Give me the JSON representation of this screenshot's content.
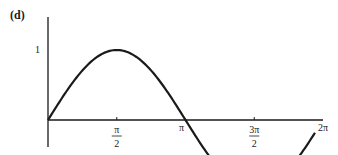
{
  "panel_label": "(d)",
  "chart_data": {
    "type": "line",
    "title": "",
    "panel": "(d)",
    "function": "sin(x)",
    "xlabel": "",
    "ylabel": "",
    "x_ticks": [
      {
        "value": 1.5708,
        "label": "π/2",
        "num": "π",
        "den": "2"
      },
      {
        "value": 3.1416,
        "label": "π"
      },
      {
        "value": 4.7124,
        "label": "3π/2",
        "num": "3π",
        "den": "2"
      },
      {
        "value": 6.2832,
        "label": "2π"
      }
    ],
    "y_ticks": [
      {
        "value": 1,
        "label": "1"
      },
      {
        "value": -1,
        "label": "−1"
      }
    ],
    "xlim": [
      0,
      6.2832
    ],
    "ylim": [
      -1.2,
      1.2
    ],
    "grid": false,
    "legend": null,
    "series": [
      {
        "name": "sin x",
        "x": [
          0,
          0.5236,
          1.0472,
          1.5708,
          2.0944,
          2.618,
          3.1416,
          3.6652,
          4.1888,
          4.7124,
          5.236,
          5.7596,
          6.1
        ],
        "values": [
          0,
          0.5,
          0.866,
          1,
          0.866,
          0.5,
          0,
          -0.5,
          -0.866,
          -1,
          -0.866,
          -0.5,
          -0.18
        ]
      }
    ]
  }
}
